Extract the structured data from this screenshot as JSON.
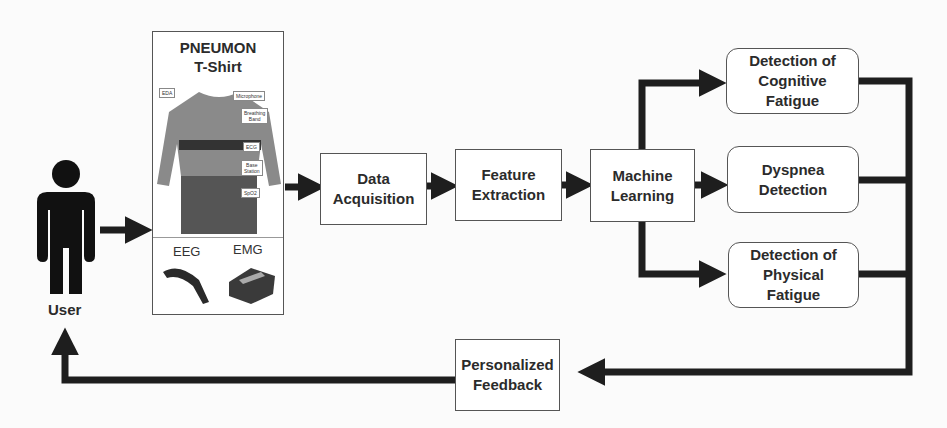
{
  "user": {
    "label": "User",
    "icon": "person-icon"
  },
  "shirt": {
    "title": "PNEUMON\nT-Shirt",
    "sensor_tags": [
      "EDA",
      "Microphone",
      "Breathing\nBand",
      "ECG",
      "Base\nStation",
      "SpO2"
    ],
    "devices": [
      {
        "label": "EEG",
        "icon": "eeg-headband-icon"
      },
      {
        "label": "EMG",
        "icon": "emg-device-icon"
      }
    ]
  },
  "pipeline": {
    "data_acquisition": "Data\nAcquisition",
    "feature_extraction": "Feature\nExtraction",
    "machine_learning": "Machine\nLearning"
  },
  "outputs": {
    "cognitive": "Detection of\nCognitive\nFatigue",
    "dyspnea": "Dyspnea\nDetection",
    "physical": "Detection of\nPhysical\nFatigue"
  },
  "feedback": {
    "label": "Personalized\nFeedback"
  },
  "colors": {
    "arrow": "#1e1e1e",
    "border": "#555555",
    "background": "#fbfbfb"
  }
}
